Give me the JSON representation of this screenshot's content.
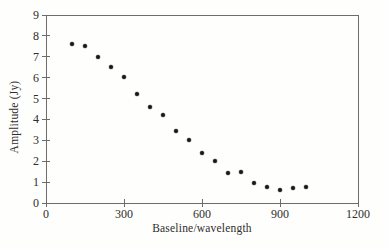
{
  "figure": {
    "background": "#fefefd",
    "line_color": "#6e6c69",
    "text_color": "#2f2d2b",
    "dot_color": "#181715"
  },
  "chart_data": {
    "type": "scatter",
    "title": "",
    "xlabel": "Baseline/wavelength",
    "ylabel": "Amplitude (Jy)",
    "xlim": [
      0,
      1200
    ],
    "ylim": [
      0,
      9
    ],
    "x_ticks": [
      0,
      300,
      600,
      900,
      1200
    ],
    "y_ticks": [
      0,
      1,
      2,
      3,
      4,
      5,
      6,
      7,
      8,
      9
    ],
    "grid": false,
    "legend": null,
    "marker": "filled-circle",
    "points": {
      "x": [
        100,
        150,
        200,
        250,
        300,
        350,
        400,
        450,
        500,
        550,
        600,
        650,
        700,
        750,
        800,
        850,
        900,
        950,
        1000
      ],
      "y": [
        7.6,
        7.5,
        7.0,
        6.5,
        6.05,
        5.2,
        4.6,
        4.2,
        3.45,
        3.0,
        2.4,
        2.0,
        1.45,
        1.5,
        0.95,
        0.75,
        0.6,
        0.7,
        0.75
      ]
    }
  }
}
